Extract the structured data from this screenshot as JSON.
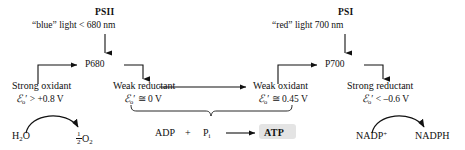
{
  "diagram": {
    "photosystems": [
      {
        "id": "psii",
        "name": "PSII",
        "light_label": "“blue” light  < 680 nm",
        "reaction_center": "P680",
        "left_role": "Strong oxidant",
        "left_potential_symbol": "ℰ",
        "left_potential_sub": "o",
        "left_potential_prime": "′",
        "left_potential_value": "> +0.8 V",
        "right_role": "Weak reductant",
        "right_potential_symbol": "ℰ",
        "right_potential_sub": "o",
        "right_potential_prime": "′",
        "right_potential_value": "≅ 0 V"
      },
      {
        "id": "psi",
        "name": "PSI",
        "light_label": "“red” light  700 nm",
        "reaction_center": "P700",
        "left_role": "Weak oxidant",
        "left_potential_symbol": "ℰ",
        "left_potential_sub": "o",
        "left_potential_prime": "′",
        "left_potential_value": "≅ 0.45 V",
        "right_role": "Strong reductant",
        "right_potential_symbol": "ℰ",
        "right_potential_sub": "o",
        "right_potential_prime": "′",
        "right_potential_value": "< –0.6 V"
      }
    ],
    "water_split": {
      "substrate": "H",
      "substrate_sub": "2",
      "substrate_tail": "O",
      "product_coefficient_num": "1",
      "product_coefficient_den": "2",
      "product": "O",
      "product_sub": "2"
    },
    "phosphorylation": {
      "adp": "ADP",
      "plus": "+",
      "pi": "P",
      "pi_sub": "i",
      "arrow": "⟶",
      "atp": "ATP",
      "atp_highlight_color": "#e4e4e4"
    },
    "nadp_reduction": {
      "substrate": "NADP",
      "substrate_sup": "+",
      "product": "NADPH"
    },
    "colors": {
      "stroke": "#111111",
      "text": "#111111",
      "background": "#ffffff"
    }
  }
}
